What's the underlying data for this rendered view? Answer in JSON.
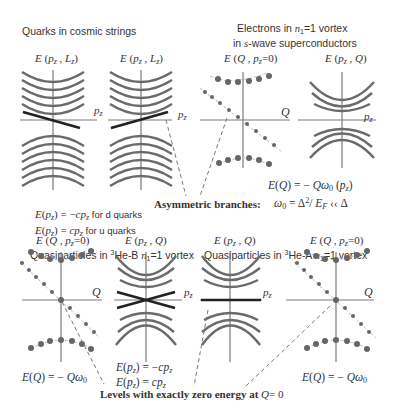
{
  "sections": {
    "quarks": {
      "title": "Quarks  in cosmic strings",
      "panel_left_label": "E (p_z , L_z)",
      "panel_right_label": "E (p_z , L_z)",
      "axis_label": "p_z",
      "formula_d": "E(p_z) = −cp_z",
      "formula_d_suffix": "for d quarks",
      "formula_u": "E(p_z) =  cp_z",
      "formula_u_suffix": "for u quarks"
    },
    "electrons": {
      "title_line1": "Electrons in n₁=1 vortex",
      "title_line2": "in s-wave superconductors",
      "panel_left_label": "E (Q , p_z=0)",
      "panel_right_label": "E (p_z , Q)",
      "axis_q": "Q",
      "axis_pz": "p_z",
      "formula_1": "E(Q)  = − Qω₀ (p_z)",
      "formula_2": "ω₀ = Δ²/ E_F  ≪ Δ"
    },
    "asymmetric": {
      "label": "Asymmetric branches:"
    },
    "he_b": {
      "title": "Quasiparticles in ³He-B n₁=1 vortex",
      "panel_left_label": "E (Q , p_z=0)",
      "panel_right_label": "E (p_z , Q)",
      "axis_q": "Q",
      "axis_pz": "p_z",
      "formula_left": "E(Q)  = − Qω₀",
      "formula_right_1": "E(p_z) = −cp_z",
      "formula_right_2": "E(p_z) =  cp_z"
    },
    "he_a": {
      "title": "Quasiparticles in ³He-A  n₁=1 vortex",
      "panel_left_label": "E (p_z , Q)",
      "panel_right_label": "E (Q , p_z=0)",
      "axis_q": "Q",
      "axis_pz": "p_z",
      "formula_right": "E(Q)  = − Qω₀"
    },
    "zero_levels": {
      "label": "Levels with exactly zero energy at",
      "label_suffix": "Q= 0"
    }
  },
  "colors": {
    "band": "#6a6a6a",
    "anomalous_branch": "#222222",
    "axis": "#7a7a7a",
    "text": "#333333"
  }
}
